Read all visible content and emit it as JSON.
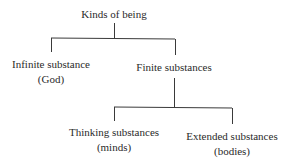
{
  "diagram": {
    "type": "tree",
    "root": {
      "label": "Kinds of being",
      "children": [
        {
          "label": "Infinite substance",
          "sublabel": "(God)"
        },
        {
          "label": "Finite substances",
          "children": [
            {
              "label": "Thinking substances",
              "sublabel": "(minds)"
            },
            {
              "label": "Extended substances",
              "sublabel": "(bodies)"
            }
          ]
        }
      ]
    },
    "line_color": "#3a3a3a",
    "text_color": "#2a2a2a"
  }
}
